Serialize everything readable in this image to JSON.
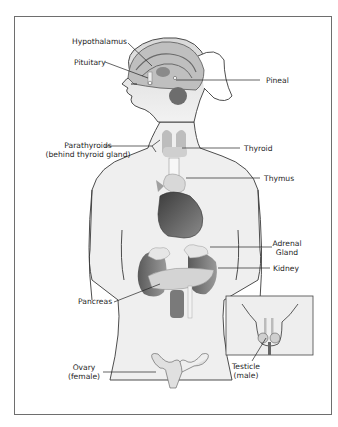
{
  "diagram": {
    "labels": {
      "hypothalamus": "Hypothalamus",
      "pituitary": "Pituitary",
      "pineal": "Pineal",
      "parathyroids_line1": "Parathyroids",
      "parathyroids_line2": "(behind thyroid gland)",
      "thyroid": "Thyroid",
      "thymus": "Thymus",
      "adrenal_line1": "Adrenal",
      "adrenal_line2": "Gland",
      "kidney": "Kidney",
      "pancreas": "Pancreas",
      "ovary_line1": "Ovary",
      "ovary_line2": "(female)",
      "testicle_line1": "Testicle",
      "testicle_line2": "(male)"
    },
    "colors": {
      "frame": "#6e6e6e",
      "body_fill": "#ececec",
      "outline": "#3a3a3a",
      "organ_dark": "#6a6a6a",
      "organ_light": "#d9d9d9",
      "text": "#1e1e1e"
    }
  }
}
